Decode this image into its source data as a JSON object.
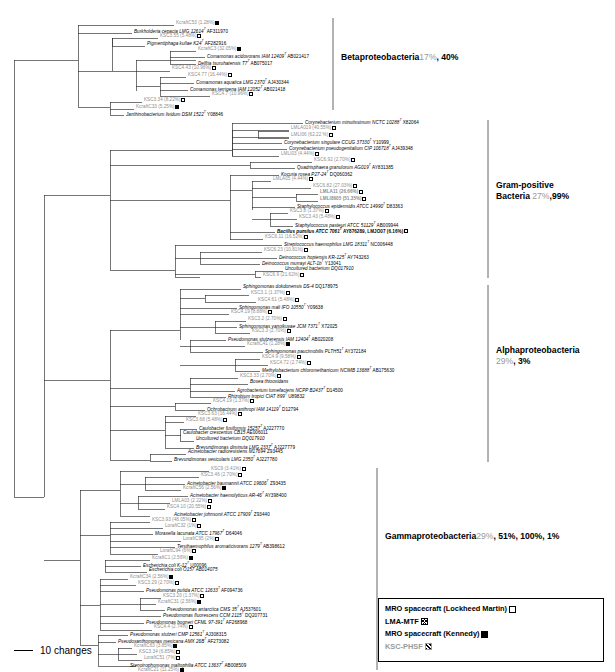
{
  "figure": {
    "type": "phylogenetic-tree",
    "scale_bar": {
      "label": "10 changes",
      "icon": "scale-bar-line"
    }
  },
  "groups": [
    {
      "name": "Betaproteobacteria",
      "percents": [
        "17%",
        "40%"
      ],
      "percent_text": " 17%, 40%"
    },
    {
      "name": "Gram-positive",
      "name2": "Bacteria",
      "percents": [
        "27%",
        "99%"
      ],
      "percent_text": " 27%,99%"
    },
    {
      "name": "Alphaproteobacteria",
      "percents": [
        "29%",
        "3%"
      ],
      "percent_text": "29%, 3%"
    },
    {
      "name": "Gammaproteobacteria",
      "percents": [
        "29%",
        "51%",
        "100%",
        "1%"
      ],
      "percent_text": " 29%, 51%, 100%, 1%"
    }
  ],
  "legend": {
    "items": [
      {
        "label": "MRO spacecraft (Lockheed Martin)",
        "marker": "open-square",
        "style": "black"
      },
      {
        "label": "LMA-MTF",
        "marker": "cross-hatched-square",
        "style": "black"
      },
      {
        "label": "MRO spacecraft (Kennedy)",
        "marker": "filled-square",
        "style": "black"
      },
      {
        "label": "KSC-PHSF",
        "marker": "diagonal-hatched-square",
        "style": "grey"
      }
    ]
  },
  "taxa": [
    {
      "id": 0,
      "text": "KcraftC53 (1.28%)",
      "marker": "filled",
      "kind": "clone",
      "x": 176,
      "y": 24
    },
    {
      "id": 1,
      "text": "Burkholderia cepacia LMG 12614",
      "sup": "T",
      "acc": " AF311970",
      "marker": "",
      "kind": "ital",
      "x": 134,
      "y": 31
    },
    {
      "id": 2,
      "text": "KSC3.55 (5.48%)",
      "marker": "cross",
      "kind": "clone",
      "x": 160,
      "y": 37
    },
    {
      "id": 3,
      "text": "Pigmentiphaga kullae K24",
      "sup": "T",
      "acc": " AF282916",
      "marker": "",
      "kind": "ital",
      "x": 147,
      "y": 43
    },
    {
      "id": 4,
      "text": "KcraftC3 (32.05%)",
      "marker": "filled",
      "kind": "clone",
      "x": 198,
      "y": 50
    },
    {
      "id": 5,
      "text": "Comamonas acidovorans IAM 12409",
      "sup": "T",
      "acc": " AB021417",
      "marker": "",
      "kind": "ital",
      "x": 207,
      "y": 56
    },
    {
      "id": 6,
      "text": "Delftia tsuruhatensis T7",
      "sup": "T",
      "acc": " AB075017",
      "marker": "",
      "kind": "ital",
      "x": 198,
      "y": 63
    },
    {
      "id": 7,
      "text": "KSC4.43 (10.96%)",
      "marker": "cross",
      "kind": "clone",
      "x": 172,
      "y": 69
    },
    {
      "id": 8,
      "text": "KSC4.77 (16.44%)",
      "marker": "cross",
      "kind": "clone",
      "x": 188,
      "y": 76
    },
    {
      "id": 9,
      "text": "Comamonas aquatica LMG 2370",
      "sup": "T",
      "acc": " AJ430344",
      "marker": "",
      "kind": "ital",
      "x": 196,
      "y": 82
    },
    {
      "id": 10,
      "text": "Comamonas terrigena IAM 12052",
      "sup": "T",
      "acc": " AB021418",
      "marker": "",
      "kind": "ital",
      "x": 190,
      "y": 89
    },
    {
      "id": 11,
      "text": "KSC4.7 (10.96%)",
      "marker": "cross",
      "kind": "clone",
      "x": 212,
      "y": 95
    },
    {
      "id": 12,
      "text": "KSC3.34 (8.22%)",
      "marker": "cross",
      "kind": "clone",
      "x": 144,
      "y": 101
    },
    {
      "id": 13,
      "text": "KcraftC33 (5.25%)",
      "marker": "filled",
      "kind": "clone",
      "x": 136,
      "y": 108
    },
    {
      "id": 14,
      "text": "Janthinobacterium lividum DSM 1522",
      "sup": "T",
      "acc": " Y08846",
      "marker": "",
      "kind": "ital",
      "x": 126,
      "y": 114
    },
    {
      "id": 15,
      "text": "Corynebacterium minutissimum NCTC 10288",
      "sup": "T",
      "acc": " X82064",
      "marker": "",
      "kind": "ital",
      "x": 305,
      "y": 122
    },
    {
      "id": 16,
      "text": "LMLA019 (40.55%)",
      "marker": "cross",
      "kind": "clone",
      "x": 291,
      "y": 129
    },
    {
      "id": 17,
      "text": "LMLI06 (62.22 %)",
      "marker": "cross",
      "kind": "clone",
      "x": 291,
      "y": 136
    },
    {
      "id": 18,
      "text": "Corynebacterium singulare CCUG 37330",
      "sup": "T",
      "acc": " Y10999",
      "marker": "",
      "kind": "ital",
      "x": 284,
      "y": 142
    },
    {
      "id": 19,
      "text": "Corynebacterium pseudogenitalium CIP 106718",
      "sup": "T",
      "acc": " AJ439348",
      "marker": "",
      "kind": "ital",
      "x": 289,
      "y": 148
    },
    {
      "id": 20,
      "text": "LMLI03 (4.44%)",
      "marker": "cross",
      "kind": "clone",
      "x": 281,
      "y": 155
    },
    {
      "id": 21,
      "text": "KSC6.92 (2.70%)",
      "marker": "cross",
      "kind": "clone",
      "x": 314,
      "y": 161
    },
    {
      "id": 22,
      "text": "Quadrisphaera granulorum AG019",
      "sup": "T",
      "acc": " AY831385",
      "marker": "",
      "kind": "ital",
      "x": 297,
      "y": 167
    },
    {
      "id": 23,
      "text": "Kocuria rosea P27-24",
      "sup": "T",
      "acc": " DQ060362",
      "marker": "",
      "kind": "ital",
      "x": 281,
      "y": 174
    },
    {
      "id": 24,
      "text": "LMLA05 (4.44%)",
      "marker": "cross",
      "kind": "clone",
      "x": 273,
      "y": 180
    },
    {
      "id": 25,
      "text": "KSC6.82 (27.03%)",
      "marker": "cross",
      "kind": "clone",
      "x": 313,
      "y": 187
    },
    {
      "id": 26,
      "text": "LMLA11 (26.66%)",
      "marker": "cross",
      "kind": "clone bold",
      "x": 320,
      "y": 193
    },
    {
      "id": 27,
      "text": "LMLI8605 (51.35%)",
      "marker": "cross",
      "kind": "clone bold",
      "x": 320,
      "y": 200
    },
    {
      "id": 28,
      "text": "Staphylococcus epidermidis ATCC 14990",
      "sup": "T",
      "acc": " D83363",
      "marker": "",
      "kind": "ital",
      "x": 297,
      "y": 206
    },
    {
      "id": 29,
      "text": "KSC3.8 (1.37%)",
      "marker": "cross",
      "kind": "clone",
      "x": 290,
      "y": 212
    },
    {
      "id": 30,
      "text": "KSC3.43 (5.48%)",
      "marker": "cross",
      "kind": "clone",
      "x": 299,
      "y": 218
    },
    {
      "id": 31,
      "text": "Staphylococcus pasteuri ATCC 51129",
      "sup": "T",
      "acc": " AB009944",
      "marker": "",
      "kind": "ital",
      "x": 295,
      "y": 225
    },
    {
      "id": 32,
      "text": "Bacillus pumilus ATCC 7061",
      "sup": "T",
      "acc": " AY876289, LMJO07 (6.16%)",
      "marker": "cross",
      "kind": "ital bold",
      "x": 277,
      "y": 231
    },
    {
      "id": 33,
      "text": "KSC6.11 (16.52%)",
      "marker": "cross",
      "kind": "clone",
      "x": 265,
      "y": 238
    },
    {
      "id": 34,
      "text": "Streptococcus haemophilus LMG 18311",
      "sup": "T",
      "acc": " NC006448",
      "marker": "",
      "kind": "ital",
      "x": 284,
      "y": 244
    },
    {
      "id": 35,
      "text": "KSC6.23 (10.81%)",
      "marker": "cross",
      "kind": "clone",
      "x": 264,
      "y": 251
    },
    {
      "id": 36,
      "text": "Deinococcus hopiensis KR-125",
      "sup": "T",
      "acc": " AY743263",
      "marker": "",
      "kind": "ital",
      "x": 279,
      "y": 257
    },
    {
      "id": 37,
      "text": "Deinococcus murrayi ALT-1b",
      "sup": "T",
      "acc": " Y13041",
      "marker": "",
      "kind": "ital",
      "x": 262,
      "y": 263
    },
    {
      "id": 38,
      "text": "Uncultured bacterium DQ017910",
      "marker": "",
      "kind": "ital",
      "x": 285,
      "y": 270
    },
    {
      "id": 39,
      "text": "KSC6.9 (21.62%)",
      "marker": "cross",
      "kind": "clone",
      "x": 263,
      "y": 276
    },
    {
      "id": 40,
      "text": "Sphingomonas dokdonensis DS-4",
      "acc": " DQ178975",
      "marker": "",
      "kind": "ital",
      "x": 243,
      "y": 288
    },
    {
      "id": 41,
      "text": "KSC3.1 (1.37%)",
      "marker": "cross",
      "kind": "clone",
      "x": 251,
      "y": 294
    },
    {
      "id": 42,
      "text": "KSC4.61 (5.48%)",
      "marker": "cross",
      "kind": "clone",
      "x": 258,
      "y": 301
    },
    {
      "id": 43,
      "text": "Sphingomonas mali IFO 10550",
      "sup": "T",
      "acc": " Y09638",
      "marker": "",
      "kind": "ital",
      "x": 239,
      "y": 307
    },
    {
      "id": 44,
      "text": "KSC4.19 (8.88%)",
      "marker": "cross",
      "kind": "clone",
      "x": 231,
      "y": 313
    },
    {
      "id": 45,
      "text": "KSC3.2 (2.70%)",
      "marker": "cross",
      "kind": "clone",
      "x": 248,
      "y": 320
    },
    {
      "id": 46,
      "text": "Sphingomonas yanoikuyae JCM 7371",
      "sup": "T",
      "acc": " X72025",
      "marker": "",
      "kind": "ital",
      "x": 239,
      "y": 326
    },
    {
      "id": 47,
      "text": "KSC3.3 (2.70%)",
      "marker": "cross",
      "kind": "clone",
      "x": 252,
      "y": 332
    },
    {
      "id": 48,
      "text": "Pseudomonas stutzerensis IAM 12404",
      "sup": "T",
      "acc": " AB020208",
      "marker": "",
      "kind": "ital",
      "x": 228,
      "y": 339
    },
    {
      "id": 49,
      "text": "KcraftC41 (1.28%)",
      "marker": "filled",
      "kind": "clone",
      "x": 247,
      "y": 345
    },
    {
      "id": 50,
      "text": "Sphingomonas paucimobilis PLTH51",
      "sup": "T",
      "acc": " AY372184",
      "marker": "",
      "kind": "ital",
      "x": 265,
      "y": 351
    },
    {
      "id": 51,
      "text": "KSC4.9 (9.58%)",
      "marker": "cross",
      "kind": "clone",
      "x": 262,
      "y": 358
    },
    {
      "id": 52,
      "text": "KSC4.72 (2.74%)",
      "marker": "cross",
      "kind": "clone",
      "x": 270,
      "y": 364
    },
    {
      "id": 53,
      "text": "Methylobacterium chloromethanicum NCIMB 13688",
      "sup": "T",
      "acc": " AB175630",
      "marker": "",
      "kind": "ital",
      "x": 262,
      "y": 370
    },
    {
      "id": 54,
      "text": "KSC3.33 (2.70%)",
      "marker": "cross",
      "kind": "clone",
      "x": 240,
      "y": 377
    },
    {
      "id": 55,
      "text": "Bosea thiooxidans",
      "marker": "",
      "kind": "ital",
      "x": 250,
      "y": 383
    },
    {
      "id": 56,
      "text": "Agrobacterium tumefaciens NCPP B2437",
      "sup": "T",
      "acc": " D14500",
      "marker": "",
      "kind": "ital",
      "x": 237,
      "y": 390
    },
    {
      "id": 57,
      "text": "Rhizobium tropici CIAT 899",
      "sup": "T",
      "acc": " U89832",
      "marker": "",
      "kind": "ital",
      "x": 228,
      "y": 396
    },
    {
      "id": 58,
      "text": "KSC4.19 (1.37%)",
      "marker": "cross",
      "kind": "clone",
      "x": 213,
      "y": 402
    },
    {
      "id": 59,
      "text": "Ochrobactrum anthropi IAM 14119",
      "sup": "T",
      "acc": " D12794",
      "marker": "",
      "kind": "ital",
      "x": 207,
      "y": 409
    },
    {
      "id": 60,
      "text": "KSC3.63 (16.44%)",
      "marker": "cross",
      "kind": "clone",
      "x": 198,
      "y": 415
    },
    {
      "id": 61,
      "text": "KSC3.68 (5.48%)",
      "marker": "cross",
      "kind": "clone",
      "x": 186,
      "y": 421
    },
    {
      "id": 62,
      "text": "Caulobacter fusiformis 15257",
      "sup": "T",
      "acc": " AJ227770",
      "marker": "",
      "kind": "ital",
      "x": 199,
      "y": 428
    },
    {
      "id": 63,
      "text": "Caulobacter crescentus CB15",
      "acc": " AE006011",
      "marker": "",
      "kind": "ital",
      "x": 183,
      "y": 434
    },
    {
      "id": 64,
      "text": "Uncultured bacterium DQ017910",
      "marker": "",
      "kind": "ital",
      "x": 196,
      "y": 440
    },
    {
      "id": 65,
      "text": "Brevundimonas diminuta LMG 2337",
      "sup": "T",
      "acc": " AJ227779",
      "marker": "",
      "kind": "ital",
      "x": 196,
      "y": 447
    },
    {
      "id": 66,
      "text": "Acinetobacter radioresistens M17694",
      "acc": " Z93445",
      "marker": "",
      "kind": "ital",
      "x": 188,
      "y": 453
    },
    {
      "id": 67,
      "text": "Brevundimonas vesicularis LMG 2350",
      "sup": "T",
      "acc": " AJ227780",
      "marker": "",
      "kind": "ital",
      "x": 174,
      "y": 459
    },
    {
      "id": 68,
      "text": "KSC9 (3.41%)",
      "marker": "cross",
      "kind": "clone",
      "x": 211,
      "y": 470
    },
    {
      "id": 69,
      "text": "KSC3.46 (2.70%)",
      "marker": "cross",
      "kind": "clone",
      "x": 201,
      "y": 476
    },
    {
      "id": 70,
      "text": "Acinetobacter baumannii ATCC 19606",
      "sup": "T",
      "acc": " Z93435",
      "marker": "",
      "kind": "ital",
      "x": 187,
      "y": 483
    },
    {
      "id": 71,
      "text": "KcraftC56 (2.56%)",
      "marker": "filled",
      "kind": "clone",
      "x": 183,
      "y": 489
    },
    {
      "id": 72,
      "text": "Acinetobacter haemolyticus AR-46",
      "sup": "T",
      "acc": " AY398400",
      "marker": "",
      "kind": "ital",
      "x": 190,
      "y": 495
    },
    {
      "id": 73,
      "text": "LMLA03 (2.22%)",
      "marker": "cross",
      "kind": "clone",
      "x": 172,
      "y": 502
    },
    {
      "id": 74,
      "text": "KSC4.10 (20.55%)",
      "marker": "cross",
      "kind": "clone",
      "x": 167,
      "y": 508
    },
    {
      "id": 75,
      "text": "Acinetobacter johnsonii ATCC 17909",
      "sup": "T",
      "acc": " Z93440",
      "marker": "",
      "kind": "ital",
      "x": 174,
      "y": 514
    },
    {
      "id": 76,
      "text": "KSC3.93 (48.05%)",
      "marker": "cross",
      "kind": "clone",
      "x": 152,
      "y": 521
    },
    {
      "id": 77,
      "text": "LoraftC32 (1%)",
      "marker": "open",
      "kind": "clone",
      "x": 165,
      "y": 527
    },
    {
      "id": 78,
      "text": "Moraxella lacunata ATCC 17967",
      "sup": "T",
      "acc": " D64046",
      "marker": "",
      "kind": "ital",
      "x": 155,
      "y": 533
    },
    {
      "id": 79,
      "text": "LoraftC95 (2%)",
      "marker": "open",
      "kind": "clone",
      "x": 183,
      "y": 540
    },
    {
      "id": 80,
      "text": "Tersihaemophilus aromaticivorans 1279",
      "sup": "T",
      "acc": " AB398612",
      "marker": "",
      "kind": "ital",
      "x": 177,
      "y": 546
    },
    {
      "id": 81,
      "text": "LoraftC94 (6%)",
      "marker": "open",
      "kind": "clone",
      "x": 160,
      "y": 552
    },
    {
      "id": 82,
      "text": "KcraftC1 (2.56%)",
      "marker": "filled",
      "kind": "clone",
      "x": 152,
      "y": 559
    },
    {
      "id": 83,
      "text": "Escherichia coli K-12",
      "sup": "T",
      "acc": " U00096",
      "marker": "",
      "kind": "ital",
      "x": 143,
      "y": 565
    },
    {
      "id": 84,
      "text": "Escherichia coli O157 AB014075",
      "marker": "",
      "kind": "ital",
      "x": 149,
      "y": 571
    },
    {
      "id": 85,
      "text": "KcraftC34 (2.56%)",
      "marker": "filled",
      "kind": "clone",
      "x": 130,
      "y": 578
    },
    {
      "id": 86,
      "text": "KSC3.29 (2.70%)",
      "marker": "cross",
      "kind": "clone",
      "x": 138,
      "y": 584
    },
    {
      "id": 87,
      "text": "Pseudomonas putida ATCC 12633",
      "sup": "T",
      "acc": " AF094736",
      "marker": "",
      "kind": "ital",
      "x": 146,
      "y": 590
    },
    {
      "id": 88,
      "text": "KSC3.20 (1.37%)",
      "marker": "cross",
      "kind": "clone",
      "x": 163,
      "y": 597
    },
    {
      "id": 89,
      "text": "KcraftC31 (2.56%)",
      "marker": "filled",
      "kind": "clone",
      "x": 158,
      "y": 603
    },
    {
      "id": 90,
      "text": "Pseudomonas antarctica CMS 35",
      "sup": "T",
      "acc": " AJ537601",
      "marker": "",
      "kind": "ital",
      "x": 167,
      "y": 609
    },
    {
      "id": 91,
      "text": "Pseudomonas fluorescens CCM 2115",
      "sup": "T",
      "acc": " DQ207731",
      "marker": "",
      "kind": "ital",
      "x": 163,
      "y": 615
    },
    {
      "id": 92,
      "text": "Pseudomonas bogneri CFML 97-391",
      "sup": "T",
      "acc": " AF268968",
      "marker": "",
      "kind": "ital",
      "x": 146,
      "y": 622
    },
    {
      "id": 93,
      "text": "KSC4.4 (2.74%)",
      "marker": "cross",
      "kind": "clone",
      "x": 154,
      "y": 628
    },
    {
      "id": 94,
      "text": "Pseudomonas stutzeri CMP 12561",
      "sup": "T",
      "acc": " AJ308315",
      "marker": "",
      "kind": "ital",
      "x": 130,
      "y": 634
    },
    {
      "id": 95,
      "text": "Pseudoxanthomonas mexicana AMX 26B",
      "sup": "T",
      "acc": " AF273082",
      "marker": "",
      "kind": "ital",
      "x": 118,
      "y": 641
    },
    {
      "id": 96,
      "text": "KcraftC63 (3.85%)",
      "marker": "filled",
      "kind": "clone",
      "x": 134,
      "y": 647
    },
    {
      "id": 97,
      "text": "KSC3.34 (6.85%)",
      "marker": "cross",
      "kind": "clone",
      "x": 139,
      "y": 653
    },
    {
      "id": 98,
      "text": "LoraftC51 (7%)",
      "marker": "open",
      "kind": "clone",
      "x": 144,
      "y": 659
    },
    {
      "id": 99,
      "text": "Stenotrophomonas maltophilia ATCC 13637",
      "sup": "T",
      "acc": " AB008509",
      "marker": "",
      "kind": "ital",
      "x": 130,
      "y": 665
    },
    {
      "id": 100,
      "text": "KcraftC21 (11.25%)",
      "marker": "filled",
      "kind": "clone",
      "x": 138,
      "y": 671
    }
  ]
}
